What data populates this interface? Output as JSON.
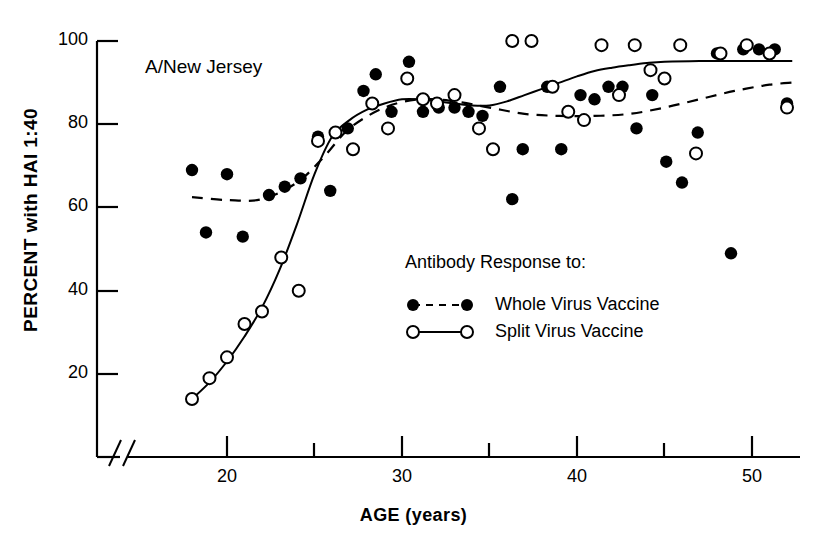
{
  "chart_data": {
    "type": "scatter",
    "title": "A/New Jersey",
    "xlabel": "AGE (years)",
    "ylabel": "PERCENT with HAI   1:40",
    "xlim": [
      17,
      52.5
    ],
    "ylim": [
      0,
      100
    ],
    "axis_break": true,
    "grid": false,
    "xticks": [
      20,
      30,
      40,
      50
    ],
    "xticks_minor": [
      25,
      35,
      45
    ],
    "yticks": [
      20,
      40,
      60,
      80,
      100
    ],
    "legend_position": "center",
    "legend_title": "Antibody Response to:",
    "series": [
      {
        "name": "Whole Virus Vaccine",
        "marker": "filled-circle",
        "line": "dashed",
        "color": "#000000",
        "points": [
          [
            18.0,
            69
          ],
          [
            20.0,
            68
          ],
          [
            18.8,
            54
          ],
          [
            20.9,
            53
          ],
          [
            22.4,
            63
          ],
          [
            23.3,
            65
          ],
          [
            24.2,
            67
          ],
          [
            25.2,
            77
          ],
          [
            25.9,
            64
          ],
          [
            26.9,
            79
          ],
          [
            27.8,
            88
          ],
          [
            28.5,
            92
          ],
          [
            29.4,
            83
          ],
          [
            30.4,
            95
          ],
          [
            31.2,
            83
          ],
          [
            32.1,
            84
          ],
          [
            33.0,
            84
          ],
          [
            33.8,
            83
          ],
          [
            34.6,
            82
          ],
          [
            35.6,
            89
          ],
          [
            36.3,
            62
          ],
          [
            36.9,
            74
          ],
          [
            38.3,
            89
          ],
          [
            39.1,
            74
          ],
          [
            40.2,
            87
          ],
          [
            41.0,
            86
          ],
          [
            41.8,
            89
          ],
          [
            42.6,
            89
          ],
          [
            43.4,
            79
          ],
          [
            44.3,
            87
          ],
          [
            45.1,
            71
          ],
          [
            46.0,
            66
          ],
          [
            46.9,
            78
          ],
          [
            48.0,
            97
          ],
          [
            48.8,
            49
          ],
          [
            49.5,
            98
          ],
          [
            50.4,
            98
          ],
          [
            51.3,
            98
          ],
          [
            52.0,
            85
          ]
        ]
      },
      {
        "name": "Split Virus Vaccine",
        "marker": "open-circle",
        "line": "solid",
        "color": "#000000",
        "points": [
          [
            18.0,
            14
          ],
          [
            19.0,
            19
          ],
          [
            20.0,
            24
          ],
          [
            21.0,
            32
          ],
          [
            22.0,
            35
          ],
          [
            23.1,
            48
          ],
          [
            24.1,
            40
          ],
          [
            25.2,
            76
          ],
          [
            26.2,
            78
          ],
          [
            27.2,
            74
          ],
          [
            28.3,
            85
          ],
          [
            29.2,
            79
          ],
          [
            30.3,
            91
          ],
          [
            31.2,
            86
          ],
          [
            32.0,
            85
          ],
          [
            33.0,
            87
          ],
          [
            34.4,
            79
          ],
          [
            35.2,
            74
          ],
          [
            36.3,
            100
          ],
          [
            37.4,
            100
          ],
          [
            38.6,
            89
          ],
          [
            39.5,
            83
          ],
          [
            40.4,
            81
          ],
          [
            41.4,
            99
          ],
          [
            42.4,
            87
          ],
          [
            43.3,
            99
          ],
          [
            44.2,
            93
          ],
          [
            45.0,
            91
          ],
          [
            45.9,
            99
          ],
          [
            46.8,
            73
          ],
          [
            48.2,
            97
          ],
          [
            49.7,
            99
          ],
          [
            51.0,
            97
          ],
          [
            52.0,
            84
          ]
        ]
      }
    ],
    "fit_curves": [
      {
        "series": "Whole Virus Vaccine",
        "style": "dashed",
        "points": [
          [
            18,
            62.5
          ],
          [
            20,
            61.8
          ],
          [
            22,
            62.0
          ],
          [
            24,
            66
          ],
          [
            25.5,
            72
          ],
          [
            27,
            79
          ],
          [
            29,
            84
          ],
          [
            31,
            86
          ],
          [
            33,
            85.5
          ],
          [
            35,
            84
          ],
          [
            37,
            82.5
          ],
          [
            39,
            82
          ],
          [
            41,
            82
          ],
          [
            43,
            82.5
          ],
          [
            45,
            84
          ],
          [
            47,
            86
          ],
          [
            49,
            88
          ],
          [
            51,
            89.5
          ],
          [
            52.3,
            90
          ]
        ]
      },
      {
        "series": "Split Virus Vaccine",
        "style": "solid",
        "points": [
          [
            18,
            14
          ],
          [
            19,
            18
          ],
          [
            20,
            23
          ],
          [
            21,
            29
          ],
          [
            22,
            36
          ],
          [
            23,
            45
          ],
          [
            24,
            56
          ],
          [
            25,
            68
          ],
          [
            26,
            77
          ],
          [
            27,
            81
          ],
          [
            28,
            83.5
          ],
          [
            29,
            85
          ],
          [
            30,
            86
          ],
          [
            31,
            86
          ],
          [
            32,
            85.5
          ],
          [
            33,
            85
          ],
          [
            34,
            84.5
          ],
          [
            35,
            84.5
          ],
          [
            36,
            85.5
          ],
          [
            37,
            87
          ],
          [
            38,
            88.5
          ],
          [
            39,
            90
          ],
          [
            40,
            91.5
          ],
          [
            41,
            92.8
          ],
          [
            42,
            93.6
          ],
          [
            43,
            94.2
          ],
          [
            44,
            94.7
          ],
          [
            45,
            95
          ],
          [
            47,
            95.2
          ],
          [
            49,
            95.2
          ],
          [
            52.3,
            95.2
          ]
        ]
      }
    ]
  },
  "legend": {
    "heading": "Antibody Response to:",
    "entries": [
      {
        "label": "Whole Virus Vaccine",
        "marker": "filled-circle",
        "line": "dashed"
      },
      {
        "label": "Split Virus Vaccine",
        "marker": "open-circle",
        "line": "solid"
      }
    ]
  },
  "axes": {
    "y_title": "PERCENT with HAI   1:40",
    "x_title": "AGE (years)",
    "y_tick_labels": [
      "100",
      "80",
      "60",
      "40",
      "20"
    ],
    "x_tick_labels": [
      "20",
      "30",
      "40",
      "50"
    ]
  },
  "title": "A/New Jersey"
}
